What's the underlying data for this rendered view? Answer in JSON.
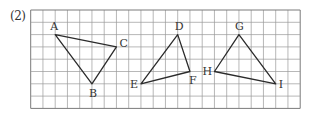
{
  "problem": {
    "label": "(2)"
  },
  "grid": {
    "columns": 22,
    "rows": 8,
    "origin_x": 30.7,
    "origin_y": 10,
    "cell_w": 12.25,
    "cell_h": 12.3,
    "line_color": "#9a9a9a",
    "border_color": "#7a7a7a"
  },
  "triangles": [
    {
      "name": "ABC",
      "vertices": [
        {
          "label": "A",
          "col": 2,
          "row": 2,
          "dx": -5,
          "dy": -5
        },
        {
          "label": "B",
          "col": 5,
          "row": 6,
          "dx": -3,
          "dy": 13
        },
        {
          "label": "C",
          "col": 7,
          "row": 3,
          "dx": 3,
          "dy": 0
        }
      ]
    },
    {
      "name": "DEF",
      "vertices": [
        {
          "label": "D",
          "col": 12,
          "row": 2,
          "dx": -3,
          "dy": -5
        },
        {
          "label": "E",
          "col": 9,
          "row": 6,
          "dx": -11,
          "dy": 4
        },
        {
          "label": "F",
          "col": 13,
          "row": 5,
          "dx": -1,
          "dy": 12
        }
      ]
    },
    {
      "name": "GHI",
      "vertices": [
        {
          "label": "G",
          "col": 17,
          "row": 2,
          "dx": -4,
          "dy": -5
        },
        {
          "label": "H",
          "col": 15,
          "row": 5,
          "dx": -12,
          "dy": 3
        },
        {
          "label": "I",
          "col": 20,
          "row": 6,
          "dx": 3,
          "dy": 4
        }
      ]
    }
  ],
  "colors": {
    "edge": "#2b2b2b",
    "label": "#333333"
  }
}
